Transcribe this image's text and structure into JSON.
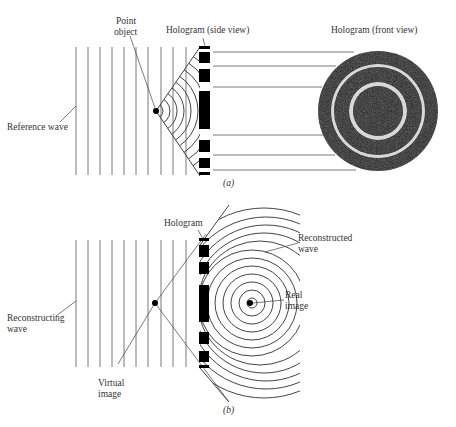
{
  "figure": {
    "panel_a": {
      "caption": "(a)",
      "labels": {
        "point_object_line1": "Point",
        "point_object_line2": "object",
        "hologram_side": "Hologram (side view)",
        "hologram_front": "Hologram (front view)",
        "reference_wave": "Reference wave"
      }
    },
    "panel_b": {
      "caption": "(b)",
      "labels": {
        "hologram": "Hologram",
        "reconstructed_line1": "Reconstructed",
        "reconstructed_line2": "wave",
        "real_line1": "Real",
        "real_line2": "image",
        "reconstructing_line1": "Reconstructing",
        "reconstructing_line2": "wave",
        "virtual_line1": "Virtual",
        "virtual_line2": "image"
      }
    }
  }
}
